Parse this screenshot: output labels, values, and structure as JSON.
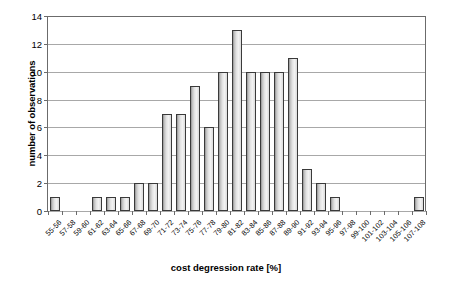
{
  "chart_data": {
    "type": "bar",
    "title": "",
    "xlabel": "cost degression rate [%]",
    "ylabel": "number of observations",
    "categories": [
      "55-56",
      "57-58",
      "59-60",
      "61-62",
      "63-64",
      "65-66",
      "67-68",
      "69-70",
      "71-72",
      "73-74",
      "75-76",
      "77-78",
      "79-80",
      "81-82",
      "83-84",
      "85-86",
      "87-88",
      "89-90",
      "91-92",
      "93-94",
      "95-96",
      "97-98",
      "99-100",
      "101-102",
      "103-104",
      "105-106",
      "107-108"
    ],
    "values": [
      1,
      0,
      0,
      1,
      1,
      1,
      2,
      2,
      7,
      7,
      9,
      6,
      10,
      13,
      10,
      10,
      10,
      11,
      3,
      2,
      1,
      0,
      0,
      0,
      0,
      0,
      1
    ],
    "ylim": [
      0,
      14
    ],
    "yticks": [
      0,
      2,
      4,
      6,
      8,
      10,
      12,
      14
    ],
    "ytick_labels": [
      "0",
      "2",
      "4",
      "6",
      "8",
      "10",
      "12",
      "14"
    ],
    "grid": true,
    "legend": false,
    "bar_fill": "#e2e2e2",
    "bar_edge": "#3a3a3a",
    "axis_color": "#6b6b6b",
    "gridline_color": "#a8a8a8"
  }
}
